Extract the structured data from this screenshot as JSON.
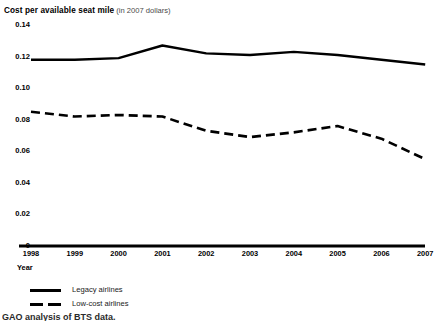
{
  "title": {
    "main": "Cost per available seat mile",
    "sub": "(in 2007 dollars)"
  },
  "axis": {
    "x_title": "Year",
    "y_ticks": [
      "0.14",
      "0.12",
      "0.10",
      "0.08",
      "0.06",
      "0.04",
      "0.02",
      "0"
    ],
    "x_ticks": [
      "1998",
      "1999",
      "2000",
      "2001",
      "2002",
      "2003",
      "2004",
      "2005",
      "2006",
      "2007"
    ]
  },
  "legend": {
    "items": [
      {
        "label": "Legacy airlines",
        "style": "solid",
        "color": "#000000"
      },
      {
        "label": "Low-cost airlines",
        "style": "dashed",
        "color": "#000000"
      }
    ]
  },
  "source": {
    "text": "GAO analysis of BTS data."
  },
  "colors": {
    "line": "#000000",
    "axis": "#000000",
    "background": "#ffffff",
    "title_sub": "#4a4a4a"
  },
  "chart_data": {
    "type": "line",
    "xlabel": "Year",
    "ylabel": "",
    "grid": false,
    "legend_position": "bottom-left",
    "ylim": [
      0,
      0.14
    ],
    "yticks": [
      0,
      0.02,
      0.04,
      0.06,
      0.08,
      0.1,
      0.12,
      0.14
    ],
    "categories": [
      "1998",
      "1999",
      "2000",
      "2001",
      "2002",
      "2003",
      "2004",
      "2005",
      "2006",
      "2007"
    ],
    "series": [
      {
        "name": "Legacy airlines",
        "style": "solid",
        "color": "#000000",
        "values": [
          0.118,
          0.118,
          0.119,
          0.127,
          0.122,
          0.121,
          0.123,
          0.121,
          0.118,
          0.115
        ]
      },
      {
        "name": "Low-cost airlines",
        "style": "dashed",
        "color": "#000000",
        "values": [
          0.085,
          0.082,
          0.083,
          0.082,
          0.073,
          0.069,
          0.072,
          0.076,
          0.068,
          0.055
        ]
      }
    ]
  }
}
